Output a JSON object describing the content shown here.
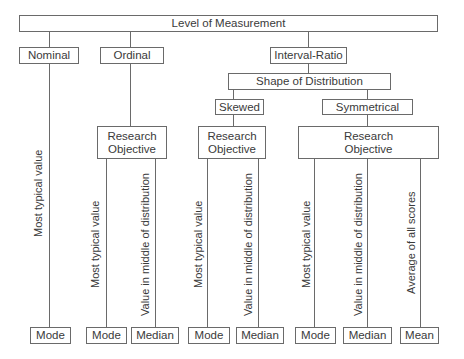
{
  "root": {
    "label": "Level of Measurement"
  },
  "levels": [
    {
      "label": "Nominal"
    },
    {
      "label": "Ordinal"
    },
    {
      "label": "Interval-Ratio"
    }
  ],
  "shape": {
    "label": "Shape of Distribution"
  },
  "distributions": [
    {
      "label": "Skewed"
    },
    {
      "label": "Symmetrical"
    }
  ],
  "research_objective": {
    "label_line1": "Research",
    "label_line2": "Objective"
  },
  "objectives": {
    "most_typical": "Most typical  value",
    "middle": "Value in middle of distribution",
    "average": "Average of all scores"
  },
  "measures": [
    {
      "label": "Mode"
    },
    {
      "label": "Mode"
    },
    {
      "label": "Median"
    },
    {
      "label": "Mode"
    },
    {
      "label": "Median"
    },
    {
      "label": "Mode"
    },
    {
      "label": "Median"
    },
    {
      "label": "Mean"
    }
  ]
}
